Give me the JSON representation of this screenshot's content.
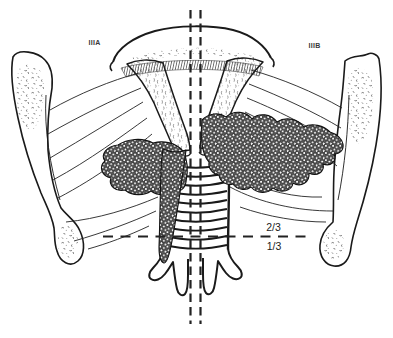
{
  "figure": {
    "stage_label_left": "IIIA",
    "stage_label_right": "IIIB",
    "upper_fraction_label": "2/3",
    "lower_fraction_label": "1/3"
  },
  "colors": {
    "ink": "#1a1a1a",
    "label_text": "#3a3a3a",
    "background": "#ffffff"
  }
}
